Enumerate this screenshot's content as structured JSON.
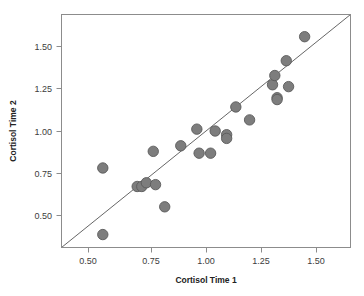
{
  "chart_data": {
    "type": "scatter",
    "title": "",
    "xlabel": "Cortisol Time 1",
    "ylabel": "Cortisol Time 2",
    "xlim": [
      0.37,
      1.63
    ],
    "ylim": [
      0.36,
      1.62
    ],
    "xticks": [
      "0.50",
      "0.75",
      "1.00",
      "1.25",
      "1.50"
    ],
    "yticks": [
      "0.50",
      "0.75",
      "1.00",
      "1.25",
      "1.50"
    ],
    "xtick_values": [
      0.5,
      0.75,
      1.0,
      1.25,
      1.5
    ],
    "ytick_values": [
      0.5,
      0.75,
      1.0,
      1.25,
      1.5
    ],
    "grid": false,
    "legend": null,
    "annotations": [
      "identity reference line y = x"
    ],
    "reference_line": {
      "type": "identity",
      "slope": 1,
      "intercept": 0
    },
    "marker": {
      "shape": "circle",
      "fill": "#7d7d7d",
      "edge": "#5a5a5a",
      "size": 5.2
    },
    "points": [
      {
        "x": 0.55,
        "y": 0.79
      },
      {
        "x": 0.55,
        "y": 0.43
      },
      {
        "x": 0.7,
        "y": 0.69
      },
      {
        "x": 0.72,
        "y": 0.69
      },
      {
        "x": 0.74,
        "y": 0.71
      },
      {
        "x": 0.78,
        "y": 0.7
      },
      {
        "x": 0.77,
        "y": 0.88
      },
      {
        "x": 0.82,
        "y": 0.58
      },
      {
        "x": 0.89,
        "y": 0.91
      },
      {
        "x": 0.96,
        "y": 1.0
      },
      {
        "x": 0.97,
        "y": 0.87
      },
      {
        "x": 1.02,
        "y": 0.87
      },
      {
        "x": 1.04,
        "y": 0.99
      },
      {
        "x": 1.09,
        "y": 0.97
      },
      {
        "x": 1.09,
        "y": 0.95
      },
      {
        "x": 1.13,
        "y": 1.12
      },
      {
        "x": 1.19,
        "y": 1.05
      },
      {
        "x": 1.29,
        "y": 1.24
      },
      {
        "x": 1.3,
        "y": 1.29
      },
      {
        "x": 1.31,
        "y": 1.17
      },
      {
        "x": 1.31,
        "y": 1.16
      },
      {
        "x": 1.35,
        "y": 1.37
      },
      {
        "x": 1.36,
        "y": 1.23
      },
      {
        "x": 1.43,
        "y": 1.5
      }
    ]
  },
  "figure": {
    "background": "#ffffff",
    "frame_color": "#8c8c8c",
    "text_color": "#3c3c3c"
  }
}
